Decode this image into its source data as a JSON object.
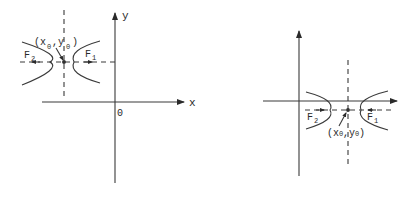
{
  "diagrams": [
    {
      "name": "hyperbola-center-second-quadrant",
      "axis_x_label": "x",
      "axis_y_label": "y",
      "origin_label": "0",
      "center_label_x": "(x",
      "center_label_x_sub": "0",
      "center_label_y": ",y",
      "center_label_y_sub": "0",
      "center_label_close": ")",
      "focus_left": "F",
      "focus_left_sub": "2",
      "focus_right": "F",
      "focus_right_sub": "1"
    },
    {
      "name": "hyperbola-center-fourth-quadrant",
      "center_label": "(x",
      "center_label_x_sub": "0",
      "center_label_mid": ",y",
      "center_label_y_sub": "0",
      "center_label_close": ")",
      "focus_left": "F",
      "focus_left_sub": "2",
      "focus_right": "F",
      "focus_right_sub": "1"
    }
  ],
  "colors": {
    "stroke": "#3a3a3a",
    "background": "#ffffff"
  }
}
